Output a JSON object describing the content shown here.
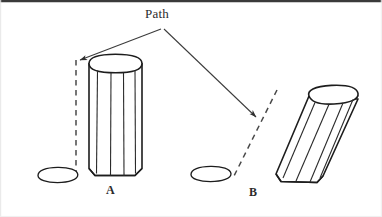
{
  "figure": {
    "type": "line-diagram",
    "background_color": "#ffffff",
    "ink_color": "#1a1a1a",
    "text_color": "#2b2b2b",
    "width": 382,
    "height": 217,
    "border": {
      "visible_edges": "top",
      "color": "#3a3a3a",
      "thickness_px": 2
    },
    "annotations": {
      "path_label": "Path",
      "leader_origin": {
        "x": 162,
        "y": 30
      },
      "leaders": [
        {
          "name": "leader-to-a",
          "from": {
            "x": 162,
            "y": 30
          },
          "to": {
            "x": 76,
            "y": 62
          },
          "arrowhead": "at-end"
        },
        {
          "name": "leader-to-b",
          "from": {
            "x": 162,
            "y": 30
          },
          "to": {
            "x": 259,
            "y": 119
          },
          "arrowhead": "at-end"
        }
      ]
    },
    "objects": [
      {
        "id": "A",
        "label": "A",
        "label_position": {
          "x": 110,
          "y": 192
        },
        "description": "upright faceted cylinder (prism) standing vertically",
        "orientation": "vertical",
        "tilt_degrees": 0,
        "resting_ellipse": {
          "cx": 57,
          "cy": 175,
          "rx": 21,
          "ry": 8
        },
        "path_line": {
          "style": "dashed",
          "from": {
            "x": 76,
            "y": 60
          },
          "to": {
            "x": 76,
            "y": 176
          }
        }
      },
      {
        "id": "B",
        "label": "B",
        "label_position": {
          "x": 253,
          "y": 194
        },
        "description": "tilted faceted cylinder (prism) leaning to the right",
        "orientation": "tilted",
        "tilt_degrees": 18,
        "resting_ellipse": {
          "cx": 211,
          "cy": 174,
          "rx": 21,
          "ry": 8
        },
        "path_line": {
          "style": "dashed",
          "from": {
            "x": 276,
            "y": 92
          },
          "to": {
            "x": 233,
            "y": 178
          }
        }
      }
    ]
  }
}
